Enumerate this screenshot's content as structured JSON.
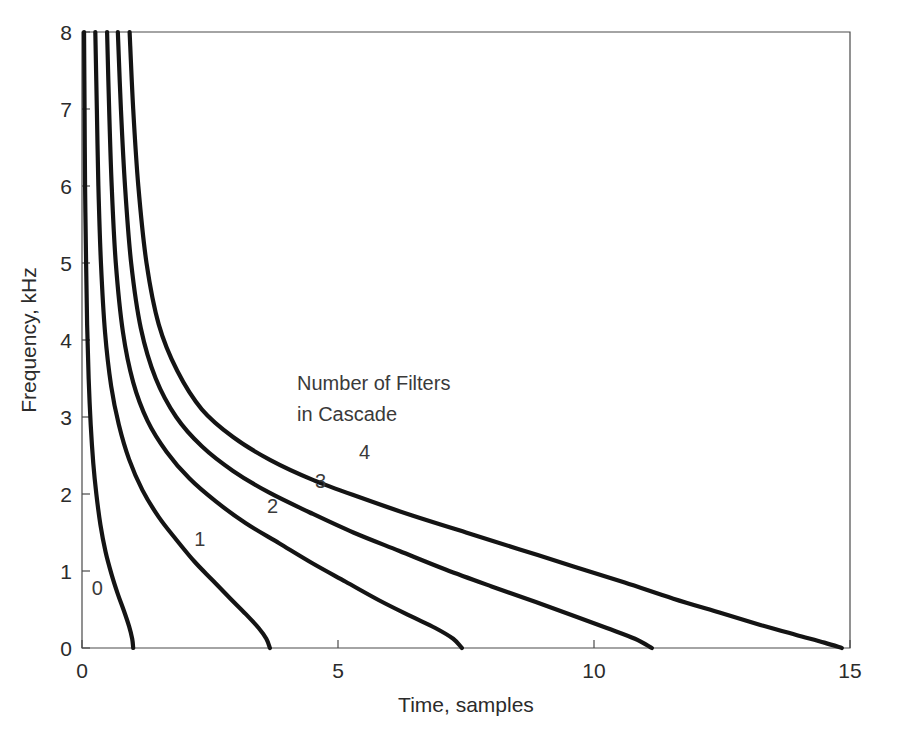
{
  "chart_data": {
    "type": "line",
    "title": "",
    "xlabel": "Time, samples",
    "ylabel": "Frequency, kHz",
    "xlim": [
      0,
      15
    ],
    "ylim": [
      0,
      8
    ],
    "xticks": [
      "0",
      "5",
      "10",
      "15"
    ],
    "xtick_values": [
      0,
      5,
      10,
      15
    ],
    "yticks": [
      "0",
      "1",
      "2",
      "3",
      "4",
      "5",
      "6",
      "7",
      "8"
    ],
    "ytick_values": [
      0,
      1,
      2,
      3,
      4,
      5,
      6,
      7,
      8
    ],
    "grid": false,
    "legend": "none",
    "annotations": [
      {
        "name": "cascade-note-line1",
        "text": "Number of Filters",
        "x": 4.2,
        "y": 3.35
      },
      {
        "name": "cascade-note-line2",
        "text": "in Cascade",
        "x": 4.2,
        "y": 2.95
      }
    ],
    "series": [
      {
        "name": "0",
        "label": "0",
        "label_x": 0.3,
        "label_y": 0.78,
        "points": [
          [
            0.04,
            8.0
          ],
          [
            0.05,
            7.0
          ],
          [
            0.06,
            6.0
          ],
          [
            0.08,
            5.0
          ],
          [
            0.1,
            4.2
          ],
          [
            0.13,
            3.5
          ],
          [
            0.17,
            2.9
          ],
          [
            0.22,
            2.4
          ],
          [
            0.28,
            2.0
          ],
          [
            0.36,
            1.6
          ],
          [
            0.46,
            1.25
          ],
          [
            0.58,
            0.95
          ],
          [
            0.7,
            0.7
          ],
          [
            0.82,
            0.48
          ],
          [
            0.92,
            0.28
          ],
          [
            0.98,
            0.12
          ],
          [
            1.0,
            0.0
          ]
        ]
      },
      {
        "name": "1",
        "label": "1",
        "label_x": 2.3,
        "label_y": 1.42,
        "points": [
          [
            0.26,
            8.0
          ],
          [
            0.29,
            7.0
          ],
          [
            0.32,
            6.0
          ],
          [
            0.37,
            5.0
          ],
          [
            0.45,
            4.1
          ],
          [
            0.57,
            3.4
          ],
          [
            0.72,
            2.9
          ],
          [
            0.92,
            2.45
          ],
          [
            1.18,
            2.05
          ],
          [
            1.5,
            1.7
          ],
          [
            1.85,
            1.4
          ],
          [
            2.2,
            1.12
          ],
          [
            2.55,
            0.88
          ],
          [
            2.9,
            0.64
          ],
          [
            3.2,
            0.44
          ],
          [
            3.45,
            0.26
          ],
          [
            3.6,
            0.12
          ],
          [
            3.67,
            0.0
          ]
        ]
      },
      {
        "name": "2",
        "label": "2",
        "label_x": 3.72,
        "label_y": 1.84,
        "points": [
          [
            0.49,
            8.0
          ],
          [
            0.53,
            7.0
          ],
          [
            0.58,
            6.0
          ],
          [
            0.66,
            5.0
          ],
          [
            0.8,
            4.1
          ],
          [
            1.0,
            3.45
          ],
          [
            1.28,
            2.95
          ],
          [
            1.65,
            2.55
          ],
          [
            2.1,
            2.2
          ],
          [
            2.62,
            1.9
          ],
          [
            3.2,
            1.62
          ],
          [
            3.85,
            1.36
          ],
          [
            4.5,
            1.1
          ],
          [
            5.15,
            0.86
          ],
          [
            5.8,
            0.62
          ],
          [
            6.4,
            0.42
          ],
          [
            6.9,
            0.26
          ],
          [
            7.25,
            0.12
          ],
          [
            7.42,
            0.0
          ]
        ]
      },
      {
        "name": "3",
        "label": "3",
        "label_x": 4.66,
        "label_y": 2.17,
        "points": [
          [
            0.7,
            8.0
          ],
          [
            0.76,
            7.0
          ],
          [
            0.84,
            6.0
          ],
          [
            0.96,
            5.0
          ],
          [
            1.15,
            4.15
          ],
          [
            1.44,
            3.5
          ],
          [
            1.84,
            3.0
          ],
          [
            2.34,
            2.62
          ],
          [
            2.95,
            2.3
          ],
          [
            3.65,
            2.02
          ],
          [
            4.45,
            1.76
          ],
          [
            5.3,
            1.5
          ],
          [
            6.2,
            1.26
          ],
          [
            7.1,
            1.02
          ],
          [
            8.0,
            0.8
          ],
          [
            8.85,
            0.6
          ],
          [
            9.6,
            0.42
          ],
          [
            10.25,
            0.26
          ],
          [
            10.8,
            0.12
          ],
          [
            11.13,
            0.0
          ]
        ]
      },
      {
        "name": "4",
        "label": "4",
        "label_x": 5.52,
        "label_y": 2.55,
        "points": [
          [
            0.93,
            8.0
          ],
          [
            1.0,
            7.0
          ],
          [
            1.1,
            6.0
          ],
          [
            1.26,
            5.0
          ],
          [
            1.5,
            4.2
          ],
          [
            1.86,
            3.6
          ],
          [
            2.34,
            3.1
          ],
          [
            2.95,
            2.74
          ],
          [
            3.68,
            2.44
          ],
          [
            4.52,
            2.18
          ],
          [
            5.45,
            1.95
          ],
          [
            6.45,
            1.72
          ],
          [
            7.5,
            1.5
          ],
          [
            8.55,
            1.28
          ],
          [
            9.6,
            1.06
          ],
          [
            10.6,
            0.85
          ],
          [
            11.55,
            0.64
          ],
          [
            12.45,
            0.46
          ],
          [
            13.25,
            0.3
          ],
          [
            13.95,
            0.17
          ],
          [
            14.5,
            0.07
          ],
          [
            14.84,
            0.0
          ]
        ]
      }
    ]
  }
}
